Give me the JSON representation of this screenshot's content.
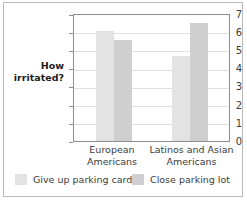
{
  "chart_data": {
    "type": "bar",
    "title": "",
    "xlabel": "",
    "ylabel": "How irritated?",
    "ylim": [
      0,
      7
    ],
    "yticks": [
      "0",
      "1",
      "2",
      "3",
      "4",
      "5",
      "6",
      "7"
    ],
    "grid": true,
    "legend_position": "bottom",
    "categories": [
      "European Americans",
      "Latinos and Asian Americans"
    ],
    "category_lines": [
      [
        "European",
        "Americans"
      ],
      [
        "Latinos and Asian",
        "Americans"
      ]
    ],
    "series": [
      {
        "name": "Give up parking card",
        "color": "#e3e3e3",
        "values": [
          6.1,
          4.75
        ]
      },
      {
        "name": "Close parking lot",
        "color": "#cfcfcf",
        "values": [
          5.6,
          6.55
        ]
      }
    ]
  },
  "colors": {
    "series_light": "#e3e3e3",
    "series_dark": "#cfcfcf",
    "axis": "#8d8d8d",
    "grid": "#e0e0e0",
    "text": "#3b3b3b",
    "frame": "#b9b9b9"
  },
  "axis": {
    "y_title": "How irritated?",
    "ticks": {
      "t0": "0",
      "t1": "1",
      "t2": "2",
      "t3": "3",
      "t4": "4",
      "t5": "5",
      "t6": "6",
      "t7": "7"
    }
  },
  "xaxis": {
    "group1_line1": "European",
    "group1_line2": "Americans",
    "group2_line1": "Latinos and Asian",
    "group2_line2": "Americans"
  },
  "legend": {
    "item1": "Give up parking card",
    "item2": "Close parking lot"
  }
}
